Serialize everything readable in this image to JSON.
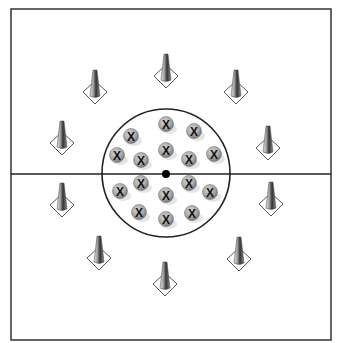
{
  "diagram": {
    "type": "soccer drill field layout",
    "field": {
      "x": 11,
      "y": 9,
      "width": 320,
      "height": 331,
      "midline_y": 174,
      "border_color": "#333333"
    },
    "center_circle": {
      "cx": 166,
      "cy": 173,
      "r": 64
    },
    "center_spot": {
      "cx": 166,
      "cy": 174,
      "r": 4
    },
    "cones": [
      {
        "id": "cone-top",
        "x": 166,
        "y": 76
      },
      {
        "id": "cone-top-right",
        "x": 236,
        "y": 92
      },
      {
        "id": "cone-right-upper",
        "x": 268,
        "y": 148
      },
      {
        "id": "cone-right-lower",
        "x": 271,
        "y": 204
      },
      {
        "id": "cone-bottom-right",
        "x": 239,
        "y": 259
      },
      {
        "id": "cone-bottom",
        "x": 165,
        "y": 284
      },
      {
        "id": "cone-bottom-left",
        "x": 99,
        "y": 258
      },
      {
        "id": "cone-left-lower",
        "x": 62,
        "y": 205
      },
      {
        "id": "cone-left-upper",
        "x": 62,
        "y": 143
      },
      {
        "id": "cone-top-left",
        "x": 95,
        "y": 92
      }
    ],
    "players": {
      "label": "X",
      "positions": [
        {
          "x": 166,
          "y": 124
        },
        {
          "x": 194,
          "y": 131
        },
        {
          "x": 131,
          "y": 136
        },
        {
          "x": 166,
          "y": 150
        },
        {
          "x": 117,
          "y": 155
        },
        {
          "x": 214,
          "y": 154
        },
        {
          "x": 141,
          "y": 160
        },
        {
          "x": 189,
          "y": 159
        },
        {
          "x": 141,
          "y": 183
        },
        {
          "x": 189,
          "y": 183
        },
        {
          "x": 120,
          "y": 191
        },
        {
          "x": 210,
          "y": 192
        },
        {
          "x": 166,
          "y": 195
        },
        {
          "x": 139,
          "y": 212
        },
        {
          "x": 192,
          "y": 213
        },
        {
          "x": 166,
          "y": 219
        }
      ]
    }
  }
}
